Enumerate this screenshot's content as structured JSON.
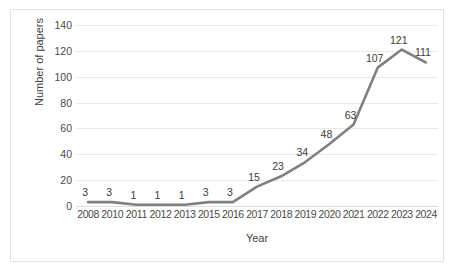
{
  "chart_data": {
    "type": "line",
    "title": "",
    "xlabel": "Year",
    "ylabel": "Number of papers",
    "categories": [
      "2008",
      "2010",
      "2011",
      "2012",
      "2013",
      "2015",
      "2016",
      "2017",
      "2018",
      "2019",
      "2020",
      "2021",
      "2022",
      "2023",
      "2024"
    ],
    "x_tick_labels": [
      "2008",
      "2010",
      "2011",
      "2012",
      "2013",
      "2015",
      "2016",
      "2017",
      "2018",
      "2019",
      "2020",
      "2021",
      "2022",
      "2023",
      "2024"
    ],
    "values": [
      3,
      3,
      1,
      1,
      1,
      3,
      3,
      15,
      23,
      34,
      48,
      63,
      107,
      121,
      111
    ],
    "point_labels": [
      "3",
      "3",
      "1",
      "1",
      "1",
      "3",
      "3",
      "15",
      "23",
      "34",
      "48",
      "63",
      "107",
      "121",
      "111"
    ],
    "y_tick_labels": [
      "140",
      "120",
      "100",
      "80",
      "60",
      "40",
      "20",
      "0"
    ],
    "y_ticks": [
      140,
      120,
      100,
      80,
      60,
      40,
      20,
      0
    ],
    "ylim": [
      0,
      140
    ],
    "grid": true,
    "legend": "none",
    "series_color": "#808080",
    "gridline_color": "#e8e8e8",
    "border_color": "#e2e2e2",
    "background_color": "#ffffff"
  }
}
